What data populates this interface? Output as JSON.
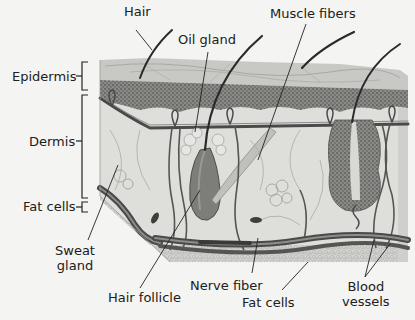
{
  "diagram": {
    "labels": {
      "hair": "Hair",
      "oil_gland": "Oil gland",
      "muscle_fibers": "Muscle fibers",
      "epidermis": "Epidermis",
      "dermis": "Dermis",
      "fat_cells_left": "Fat cells",
      "sweat_gland_1": "Sweat",
      "sweat_gland_2": "gland",
      "hair_follicle": "Hair follicle",
      "nerve_fiber": "Nerve fiber",
      "fat_cells_bottom": "Fat cells",
      "blood_vessels_1": "Blood",
      "blood_vessels_2": "vessels"
    },
    "colors": {
      "background": "#f4f4f2",
      "epidermis_top": "#c9c9c6",
      "epidermis_texture": "#777775",
      "dermis": "#dededb",
      "vessel": "#4a4a4a",
      "leader_line": "#222222"
    }
  }
}
